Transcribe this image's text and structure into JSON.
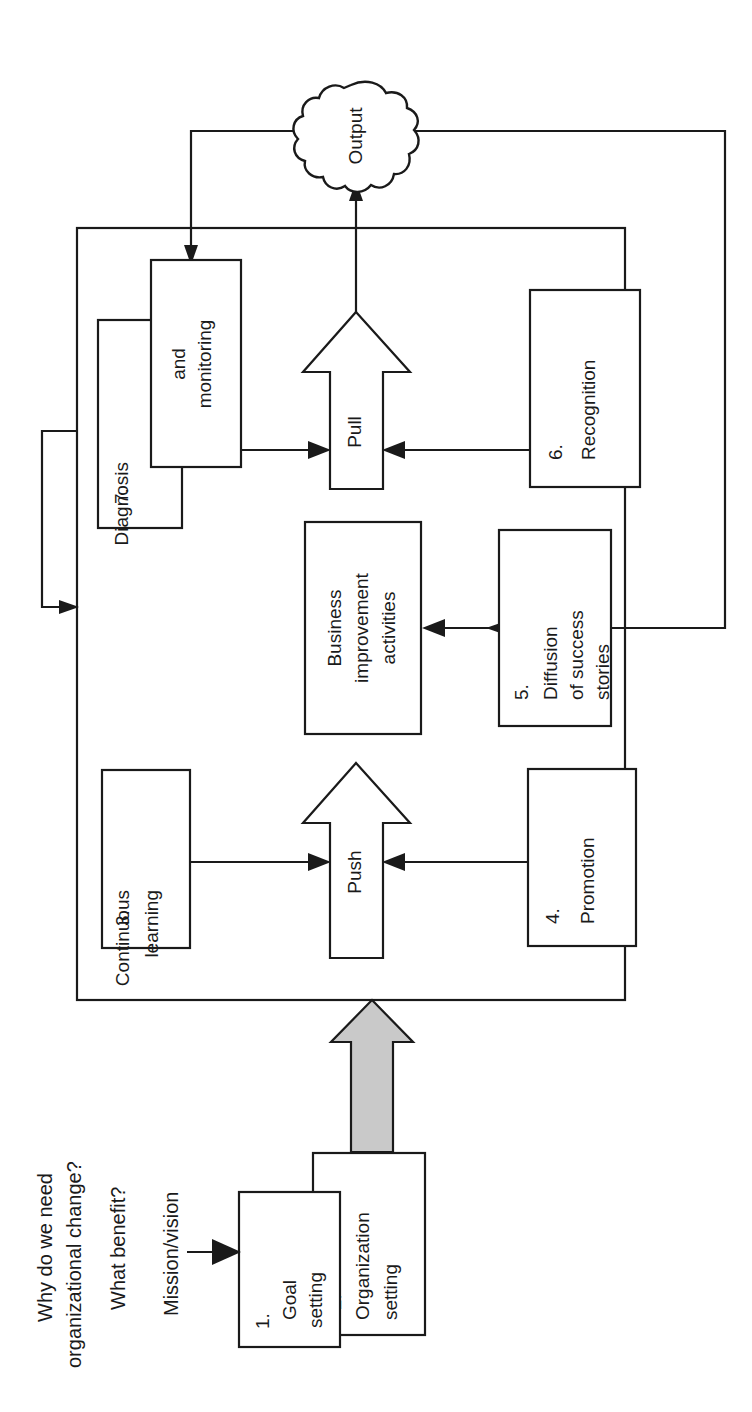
{
  "diagram": {
    "orientation": "rotated-90-ccw",
    "colors": {
      "stroke": "#1a1a1a",
      "box_fill": "#ffffff",
      "gray_arrow_fill": "#c9c9c9",
      "background": "#ffffff"
    },
    "questions": [
      {
        "id": "q1",
        "text": "Why do we need"
      },
      {
        "id": "q1b",
        "text": "organizational change?"
      },
      {
        "id": "q2",
        "text": "What benefit?"
      },
      {
        "id": "q3",
        "text": "Mission/vision"
      }
    ],
    "nodes": [
      {
        "id": "n1",
        "number": "1.",
        "lines": [
          "Goal",
          "setting"
        ]
      },
      {
        "id": "n2",
        "number": "2.",
        "lines": [
          "Organization",
          "setting"
        ]
      },
      {
        "id": "n3",
        "number": "3.",
        "lines": [
          "Continuous",
          "learning"
        ]
      },
      {
        "id": "n4",
        "number": "4.",
        "lines": [
          "Promotion"
        ]
      },
      {
        "id": "n5",
        "number": "5.",
        "lines": [
          "Diffusion",
          "of success",
          "stories"
        ]
      },
      {
        "id": "n6",
        "number": "6.",
        "lines": [
          "Recognition"
        ]
      },
      {
        "id": "n7",
        "number": "7.",
        "lines": [
          "Diagnosis"
        ]
      },
      {
        "id": "n7b",
        "number": "",
        "lines": [
          "and",
          "monitoring"
        ]
      },
      {
        "id": "nbia",
        "number": "",
        "lines": [
          "Business",
          "improvement",
          "activities"
        ]
      }
    ],
    "block_arrows": [
      {
        "id": "push",
        "label": "Push"
      },
      {
        "id": "pull",
        "label": "Pull"
      }
    ],
    "cloud": {
      "id": "output",
      "label": "Output"
    },
    "labels": {
      "q_why_1": "Why do we need",
      "q_why_2": "organizational change?",
      "q_benefit": "What benefit?",
      "q_mission": "Mission/vision",
      "n1_num": "1.",
      "n1_l1": "Goal",
      "n1_l2": "setting",
      "n2_num": "2.",
      "n2_l1": "Organization",
      "n2_l2": "setting",
      "n3_num": "3.",
      "n3_l1": "Continuous",
      "n3_l2": "learning",
      "n4_num": "4.",
      "n4_l1": "Promotion",
      "n5_num": "5.",
      "n5_l1": "Diffusion",
      "n5_l2": "of success",
      "n5_l3": "stories",
      "n6_num": "6.",
      "n6_l1": "Recognition",
      "n7_num": "7.",
      "n7_l1": "Diagnosis",
      "n7b_l1": "and",
      "n7b_l2": "monitoring",
      "bia_l1": "Business",
      "bia_l2": "improvement",
      "bia_l3": "activities",
      "push": "Push",
      "pull": "Pull",
      "output": "Output"
    }
  }
}
